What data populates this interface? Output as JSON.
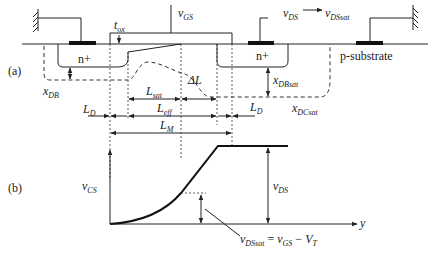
{
  "diagram": {
    "panel_a": {
      "label": "(a)",
      "terminals": {
        "gate": "v",
        "gate_sub": "GS",
        "drain": "v",
        "drain_sub": "DS",
        "drain_sat": "v",
        "drain_sat_sub": "DSsat"
      },
      "regions": {
        "source": "n+",
        "drain": "n+",
        "substrate": "p-substrate"
      },
      "dimensions": {
        "tox": "t",
        "tox_sub": "ox",
        "xDB": "x",
        "xDB_sub": "DB",
        "xDBsat": "x",
        "xDBsat_sub": "DBsat",
        "xDCsat": "x",
        "xDCsat_sub": "DCsat",
        "delta_L": "ΔL",
        "Lsat": "L",
        "Lsat_sub": "sat",
        "Leff": "L",
        "Leff_sub": "eff",
        "LD_left": "L",
        "LD_left_sub": "D",
        "LD_right": "L",
        "LD_right_sub": "D",
        "LM": "L",
        "LM_sub": "M"
      }
    },
    "panel_b": {
      "label": "(b)",
      "y_axis": "v",
      "y_axis_sub": "CS",
      "x_axis": "y",
      "vds": "v",
      "vds_sub": "DS",
      "equation_lhs": "v",
      "equation_lhs_sub": "DSsat",
      "equation_eq": " = ",
      "equation_r1": "v",
      "equation_r1_sub": "GS",
      "equation_minus": " − ",
      "equation_r2": "V",
      "equation_r2_sub": "T"
    }
  }
}
